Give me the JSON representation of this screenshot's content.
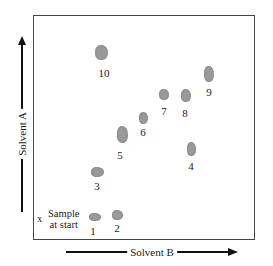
{
  "diagram": {
    "type": "two-dimensional chromatography",
    "axes": {
      "vertical_label": "Solvent A",
      "horizontal_label": "Solvent B"
    },
    "start_marker": {
      "symbol": "x",
      "label_line1": "Sample",
      "label_line2": "at start"
    },
    "spots": [
      {
        "id": "1",
        "label": "1"
      },
      {
        "id": "2",
        "label": "2"
      },
      {
        "id": "3",
        "label": "3"
      },
      {
        "id": "4",
        "label": "4"
      },
      {
        "id": "5",
        "label": "5"
      },
      {
        "id": "6",
        "label": "6"
      },
      {
        "id": "7",
        "label": "7"
      },
      {
        "id": "8",
        "label": "8"
      },
      {
        "id": "9",
        "label": "9"
      },
      {
        "id": "10",
        "label": "10"
      }
    ],
    "colors": {
      "spot": "#9a9a9a",
      "frame": "#444444",
      "arrow": "#111111"
    }
  }
}
